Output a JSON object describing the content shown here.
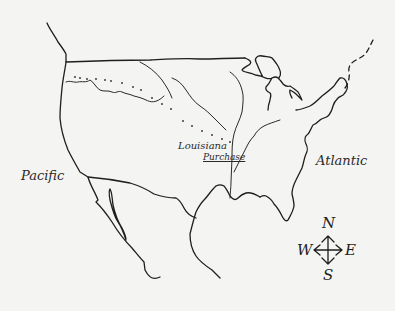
{
  "map": {
    "title": "Louisiana Purchase",
    "labels": {
      "pacific": "Pacific",
      "atlantic": "Atlantic",
      "louisiana_line1": "Louisiana",
      "louisiana_line2": "Purchase"
    },
    "compass": {
      "north": "N",
      "south": "S",
      "east": "E",
      "west": "W"
    },
    "colors": {
      "background": "#f4f4f2",
      "ink": "#1e1e1e"
    }
  }
}
